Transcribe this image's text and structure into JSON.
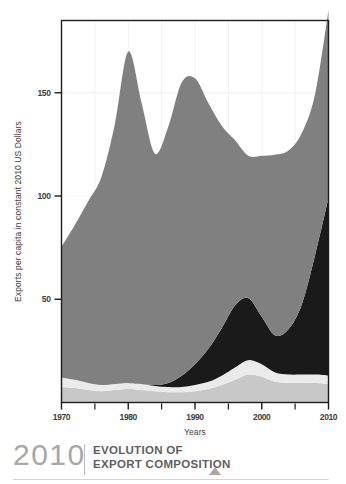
{
  "caption": {
    "year": "2010",
    "line1": "EVOLUTION OF",
    "line2": "EXPORT COMPOSITION",
    "marker_icon": "triangle-up-icon"
  },
  "chart_data": {
    "type": "area",
    "stacked": true,
    "title": "",
    "xlabel": "Years",
    "ylabel": "Exports per capita in constant 2010 US Dollars",
    "xlim": [
      1970,
      2010
    ],
    "ylim": [
      0,
      185
    ],
    "xticks": [
      1970,
      1980,
      1990,
      2000,
      2010
    ],
    "xtick_labels": [
      "1970",
      "1980",
      "1990",
      "2000",
      "2010"
    ],
    "xticks_minor": [
      1975,
      1985,
      1995,
      2005
    ],
    "yticks": [
      50,
      100,
      150
    ],
    "ytick_labels": [
      "50",
      "100",
      "150"
    ],
    "grid": true,
    "legend": "none",
    "x": [
      1970,
      1972,
      1974,
      1976,
      1978,
      1980,
      1982,
      1984,
      1986,
      1988,
      1990,
      1992,
      1994,
      1996,
      1998,
      2000,
      2002,
      2004,
      2006,
      2008,
      2010
    ],
    "series": [
      {
        "name": "layer-1-bottom",
        "color": "#c8c8c8",
        "values": [
          7.5,
          7.0,
          6.0,
          5.5,
          6.0,
          6.5,
          6.0,
          5.5,
          5.0,
          5.0,
          5.5,
          6.5,
          8.5,
          11.0,
          13.5,
          12.5,
          10.0,
          9.5,
          9.5,
          9.5,
          9.0
        ]
      },
      {
        "name": "layer-2-pale",
        "color": "#ebebeb",
        "values": [
          4.5,
          4.0,
          3.5,
          3.0,
          3.0,
          3.0,
          3.0,
          2.5,
          2.5,
          2.5,
          3.0,
          3.5,
          4.5,
          6.0,
          7.0,
          6.0,
          4.5,
          4.0,
          4.0,
          4.0,
          4.0
        ]
      },
      {
        "name": "layer-3-dark",
        "color": "#1a1a1a",
        "values": [
          0.0,
          0.0,
          0.0,
          0.0,
          0.0,
          0.0,
          0.0,
          0.5,
          2.0,
          5.5,
          10.0,
          16.0,
          23.0,
          30.0,
          30.0,
          23.0,
          18.0,
          22.0,
          34.0,
          58.0,
          86.0
        ]
      },
      {
        "name": "layer-4-gray",
        "color": "#808080",
        "values": [
          63.5,
          75.0,
          88.0,
          101.0,
          126.0,
          160.5,
          136.0,
          112.0,
          124.0,
          142.0,
          138.5,
          119.0,
          98.0,
          80.0,
          69.0,
          78.0,
          87.5,
          86.5,
          83.0,
          78.0,
          91.0
        ]
      }
    ],
    "totals": [
      75.5,
      86.0,
      97.5,
      109.5,
      135.0,
      170.0,
      145.0,
      120.5,
      133.5,
      155.0,
      157.0,
      145.0,
      134.0,
      127.0,
      119.5,
      119.5,
      120.0,
      122.0,
      130.5,
      149.5,
      190.0
    ]
  }
}
